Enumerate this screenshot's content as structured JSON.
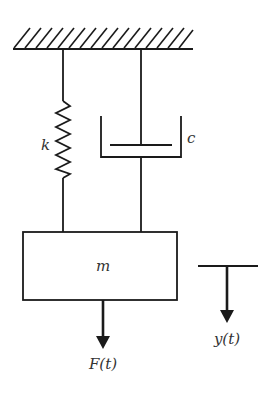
{
  "diagram": {
    "type": "mass-spring-damper",
    "colors": {
      "stroke": "#1a1a1a",
      "text": "#333333",
      "background": "#ffffff"
    },
    "labels": {
      "spring": "k",
      "damper": "c",
      "mass": "m",
      "force": "F(t)",
      "displacement": "y(t)"
    },
    "components": [
      {
        "id": "ground",
        "kind": "fixed-support-hatched"
      },
      {
        "id": "spring",
        "kind": "spring",
        "label": "k"
      },
      {
        "id": "damper",
        "kind": "dashpot",
        "label": "c"
      },
      {
        "id": "mass",
        "kind": "block",
        "label": "m"
      },
      {
        "id": "force-arrow",
        "kind": "arrow-down",
        "label": "F(t)"
      },
      {
        "id": "displacement-indicator",
        "kind": "arrow-down-with-reference-line",
        "label": "y(t)"
      }
    ]
  }
}
